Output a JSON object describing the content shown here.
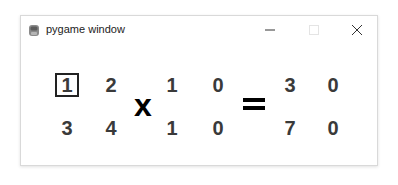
{
  "window": {
    "title": "pygame window",
    "icon": "pygame-snake-icon",
    "controls": {
      "minimize": "minimize-icon",
      "maximize": "maximize-icon",
      "close": "close-icon"
    }
  },
  "equation": {
    "matrix_a": {
      "rows": [
        [
          "1",
          "2"
        ],
        [
          "3",
          "4"
        ]
      ],
      "selected_cell": [
        0,
        0
      ]
    },
    "operator_1": "x",
    "matrix_b": {
      "rows": [
        [
          "1",
          "0"
        ],
        [
          "1",
          "0"
        ]
      ]
    },
    "operator_2": "=",
    "result": {
      "rows": [
        [
          "3",
          "0"
        ],
        [
          "7",
          "0"
        ]
      ]
    }
  },
  "colors": {
    "digit": "#3a3a3a",
    "operator": "#000000",
    "selection_border": "#222222",
    "window_border": "#d9d9d9"
  }
}
